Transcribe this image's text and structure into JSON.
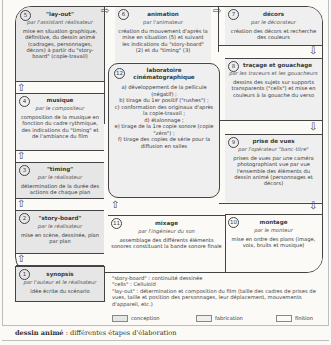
{
  "steps": {
    "s5": {
      "num": "5",
      "title": "\"lay-out\"",
      "by": "par l'assistant réalisateur",
      "desc": "mise en situation graphique, définitive, du dessin animé (cadrages, personnages, décors) à partir du \"story-board\" (copie-travail)"
    },
    "s6": {
      "num": "6",
      "title": "animation",
      "by": "par l'animateur",
      "desc": "création du mouvement d'après la mise en situation (5) et suivant les indications du \"story-board\" (2) et du \"timing\" (3)"
    },
    "s7": {
      "num": "7",
      "title": "décors",
      "by": "par le décorateur",
      "desc": "création des décors et recherche des couleurs"
    },
    "s8": {
      "num": "8",
      "title": "traçage et gouachage",
      "by": "par les traceurs et les gouacheurs",
      "desc": "dessins des sujets sur supports transparents (\"cells\") et mise en couleurs à la gouache du verso"
    },
    "s4": {
      "num": "4",
      "title": "musique",
      "by": "par le compositeur",
      "desc": "composition de la musique en fonction du cadre rythmique, des indications du \"timing\" et de l'ambiance du film"
    },
    "s3": {
      "num": "3",
      "title": "\"timing\"",
      "by": "par le réalisateur",
      "desc": "détermination de la durée des actions de chaque plan"
    },
    "s2": {
      "num": "2",
      "title": "\"story-board\"",
      "by": "par le réalisateur",
      "desc": "mise en scène, dessinée, plan par plan"
    },
    "s1": {
      "num": "1",
      "title": "synopsis",
      "by": "par l'auteur et le réalisateur",
      "desc": "idée écrite du scénario"
    },
    "s9": {
      "num": "9",
      "title": "prise de vues",
      "by": "par l'opérateur \"banc-titre\"",
      "desc": "prises de vues par une caméra photographiant vue par vue l'ensemble des éléments du dessin animé (personnages et décors)"
    },
    "s10": {
      "num": "10",
      "title": "montage",
      "by": "par le monteur",
      "desc": "mise en ordre des plans (image, voix, bruits et musique)"
    },
    "s11": {
      "num": "11",
      "title": "mixage",
      "by": "par l'ingénieur du son",
      "desc": "assemblage des différents éléments sonores constituant la bande sonore finale"
    },
    "s12": {
      "num": "12",
      "title": "laboratoire cinématographique",
      "items": [
        "a) développement de la pellicule (négatif) ;",
        "b) tirage du 1er positif (\"rushes\") ;",
        "c) conformation des originaux d'après la copie-travail ;",
        "d) étalonnage ;",
        "e) tirage de la 1re copie sonore (copie \"zéro\") ;",
        "f) tirage des copies de série pour la diffusion en salles"
      ]
    }
  },
  "glossary": [
    "\"story-board\" : continuité dessinée",
    "\"cells\" : Celluloïd",
    "\"lay-out\" : détermination et composition du film (taille des cadres de prises de vues, taille et position des personnages, leur déplacement, mouvements d'appareil, etc.)"
  ],
  "legend": [
    {
      "label": "conception",
      "color": "#e6e6e6"
    },
    {
      "label": "fabrication",
      "color": "#efefef"
    },
    {
      "label": "finition",
      "color": "#fbfaf6"
    }
  ],
  "caption": {
    "bold": "dessin animé",
    "rest": " : différentes étapes d'élaboration"
  }
}
